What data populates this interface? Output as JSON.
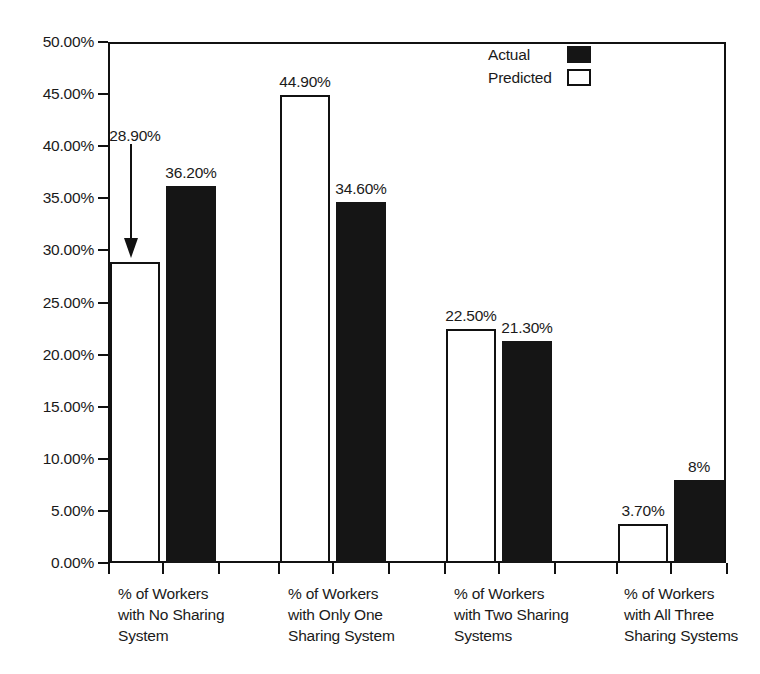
{
  "chart_data": {
    "type": "bar",
    "title": "",
    "subtitle": "",
    "xlabel": "",
    "ylabel": "",
    "ylim": [
      0,
      50
    ],
    "grid": false,
    "legend_position": "top-right",
    "categories": [
      "% of Workers\nwith No Sharing\nSystem",
      "% of Workers\nwith Only One\nSharing System",
      "% of Workers\nwith Two Sharing\nSystems",
      "% of Workers\nwith All Three\nSharing Systems"
    ],
    "series": [
      {
        "name": "Predicted",
        "color": "#ffffff",
        "values": [
          28.9,
          44.9,
          22.5,
          3.7
        ],
        "labels": [
          "28.90%",
          "44.90%",
          "22.50%",
          "3.70%"
        ]
      },
      {
        "name": "Actual",
        "color": "#151515",
        "values": [
          36.2,
          34.6,
          21.3,
          8.0
        ],
        "labels": [
          "36.20%",
          "34.60%",
          "21.30%",
          "8%"
        ]
      }
    ],
    "ytick_labels": [
      "50.00%",
      "45.00%",
      "40.00%",
      "35.00%",
      "30.00%",
      "25.00%",
      "20.00%",
      "15.00%",
      "10.00%",
      "5.00%",
      "0.00%"
    ],
    "ytick_values": [
      50,
      45,
      40,
      35,
      30,
      25,
      20,
      15,
      10,
      5,
      0
    ],
    "annotations": [
      {
        "text": "28.90%",
        "type": "arrow",
        "points_to": "predicted bar of category 1"
      }
    ]
  },
  "legend": {
    "entries": [
      {
        "label": "Actual",
        "swatch": "filled-square"
      },
      {
        "label": "Predicted",
        "swatch": "hollow-square"
      }
    ]
  },
  "colors": {
    "actual": "#151515",
    "predicted": "#ffffff",
    "axis": "#111111",
    "background": "#ffffff"
  }
}
